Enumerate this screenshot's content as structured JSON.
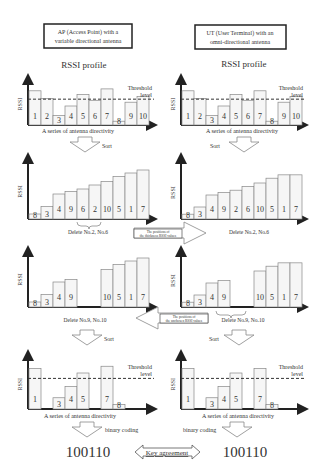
{
  "left_column": {
    "title_line1": "AP (Access Point) with a",
    "title_line2": "variable directional antenna",
    "profile_title": "RSSI profile",
    "axis_label": "RSSI",
    "threshold_label_1": "Threshold",
    "threshold_label_2": "level",
    "x_caption": "A series of antenna directivity",
    "sort_label": "Sort",
    "delete_1": "Delete No.2, No.6",
    "delete_2": "Delete No.9, No.10",
    "sort_label_2": "Sort",
    "x_caption_2": "A series of antenna directivity",
    "coding_label": "binary coding",
    "key": "100110"
  },
  "right_column": {
    "title_line1": "UT (User Terminal) with an",
    "title_line2": "omni-directional antenna",
    "profile_title": "RSSI profile",
    "axis_label": "RSSI",
    "threshold_label_1": "Threshold",
    "threshold_label_2": "level",
    "x_caption": "A series of antenna directivity",
    "sort_label": "Sort",
    "delete_1": "Delete No.2, No.6",
    "delete_2": "Delete No.9, No.10",
    "sort_label_2": "Sort",
    "x_caption_2": "A series of antenna directivity",
    "coding_label": "binary coding",
    "key": "100110"
  },
  "middle": {
    "arrow_1_line1": "The positions of",
    "arrow_1_line2": "the thickness RSSI values",
    "arrow_2_line1": "The positions of",
    "arrow_2_line2": "the unchosen RSSI values",
    "key_agreement": "Key agreement"
  },
  "chart_data": [
    {
      "type": "bar",
      "title": "RSSI profile (AP)",
      "ylabel": "RSSI",
      "xlabel": "A series of antenna directivity",
      "categories": [
        "1",
        "2",
        "3",
        "4",
        "5",
        "6",
        "7",
        "8",
        "9",
        "10"
      ],
      "values": [
        9,
        7,
        2.5,
        5,
        8,
        6.5,
        9.5,
        1,
        6,
        7.5
      ],
      "threshold": 6.8
    },
    {
      "type": "bar",
      "title": "RSSI profile (UT)",
      "ylabel": "RSSI",
      "xlabel": "A series of antenna directivity",
      "categories": [
        "1",
        "2",
        "3",
        "4",
        "5",
        "6",
        "7",
        "8",
        "9",
        "10"
      ],
      "values": [
        9,
        7,
        2.5,
        5,
        8,
        6.5,
        9,
        1,
        6,
        7.5
      ],
      "threshold": 6.8
    },
    {
      "type": "bar",
      "title": "Sorted (AP)",
      "categories": [
        "8",
        "3",
        "4",
        "9",
        "6",
        "2",
        "10",
        "5",
        "1",
        "7"
      ],
      "values": [
        1,
        2.5,
        5,
        5.5,
        6,
        6.8,
        7.5,
        8.5,
        9.2,
        9.8
      ]
    },
    {
      "type": "bar",
      "title": "Sorted (UT)",
      "categories": [
        "8",
        "3",
        "4",
        "9",
        "2",
        "6",
        "10",
        "5",
        "1",
        "7"
      ],
      "values": [
        1,
        2.5,
        5,
        5.5,
        6,
        6.8,
        7.5,
        8.5,
        9.2,
        9.2
      ]
    },
    {
      "type": "bar",
      "title": "After deletion (AP)",
      "categories": [
        "8",
        "3",
        "4",
        "9",
        "10",
        "5",
        "1",
        "7"
      ],
      "values": [
        1,
        2.5,
        5,
        5.5,
        7.5,
        8.5,
        9.2,
        9.8
      ]
    },
    {
      "type": "bar",
      "title": "After deletion (UT)",
      "categories": [
        "8",
        "3",
        "4",
        "9",
        "10",
        "5",
        "1",
        "7"
      ],
      "values": [
        1,
        2.5,
        5,
        5.5,
        7.5,
        8.5,
        9.2,
        9.2
      ]
    },
    {
      "type": "bar",
      "title": "Re-sorted (AP)",
      "categories": [
        "1",
        "3",
        "4",
        "5",
        "7",
        "8"
      ],
      "values": [
        9,
        2.5,
        5,
        8,
        9.5,
        1
      ],
      "threshold": 6.8,
      "binary": "100110"
    },
    {
      "type": "bar",
      "title": "Re-sorted (UT)",
      "categories": [
        "1",
        "3",
        "4",
        "5",
        "7",
        "8"
      ],
      "values": [
        9,
        2.5,
        5,
        8,
        9,
        1
      ],
      "threshold": 6.8,
      "binary": "100110"
    }
  ]
}
